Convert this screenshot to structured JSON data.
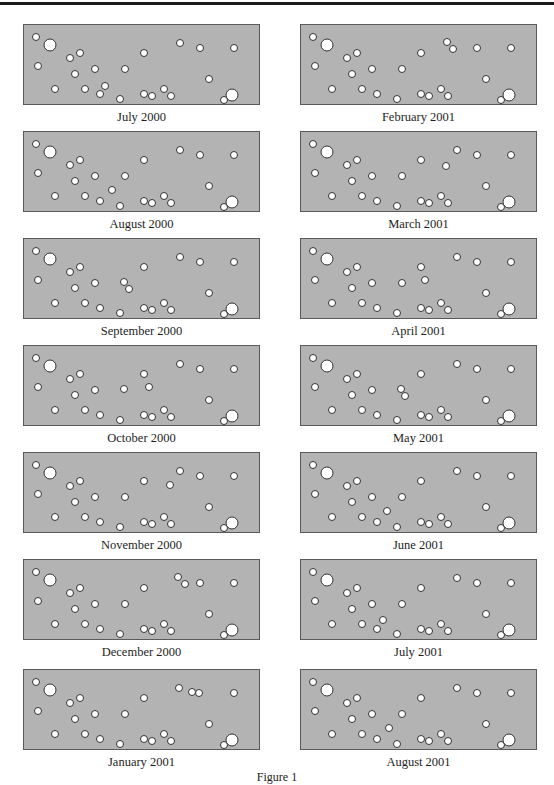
{
  "figure": {
    "caption": "Figure 1",
    "panel_fill": "#b3b3b3",
    "dot_fill": "#ffffff",
    "dot_stroke": "#333333"
  },
  "panels": [
    {
      "label": "July 2000",
      "column": 0,
      "row": 0,
      "variant": "base"
    },
    {
      "label": "August 2000",
      "column": 0,
      "row": 1,
      "variant": "aug2000"
    },
    {
      "label": "September 2000",
      "column": 0,
      "row": 2,
      "variant": "sep2000"
    },
    {
      "label": "October 2000",
      "column": 0,
      "row": 3,
      "variant": "oct2000"
    },
    {
      "label": "November 2000",
      "column": 0,
      "row": 4,
      "variant": "nov2000"
    },
    {
      "label": "December 2000",
      "column": 0,
      "row": 5,
      "variant": "dec2000"
    },
    {
      "label": "January 2001",
      "column": 0,
      "row": 6,
      "variant": "jan2001"
    },
    {
      "label": "February 2001",
      "column": 1,
      "row": 0,
      "variant": "feb2001"
    },
    {
      "label": "March 2001",
      "column": 1,
      "row": 1,
      "variant": "mar2001"
    },
    {
      "label": "April 2001",
      "column": 1,
      "row": 2,
      "variant": "apr2001"
    },
    {
      "label": "May 2001",
      "column": 1,
      "row": 3,
      "variant": "may2001"
    },
    {
      "label": "June 2001",
      "column": 1,
      "row": 4,
      "variant": "jun2001"
    },
    {
      "label": "July 2001",
      "column": 1,
      "row": 5,
      "variant": "jul2001"
    },
    {
      "label": "August 2001",
      "column": 1,
      "row": 6,
      "variant": "aug2001"
    }
  ],
  "dots": {
    "common": [
      [
        12,
        12,
        3.5
      ],
      [
        26,
        20,
        6
      ],
      [
        46,
        33,
        3.5
      ],
      [
        56,
        28,
        3.5
      ],
      [
        14,
        41,
        3.5
      ],
      [
        51,
        49,
        3.5
      ],
      [
        71,
        44,
        3.5
      ],
      [
        120,
        28,
        3.5
      ],
      [
        210,
        23,
        3.5
      ],
      [
        31,
        64,
        3.5
      ],
      [
        61,
        64,
        3.5
      ],
      [
        76,
        69,
        3.5
      ],
      [
        96,
        74,
        3.5
      ],
      [
        120,
        69,
        3.5
      ],
      [
        128,
        71,
        3.5
      ],
      [
        140,
        64,
        3.5
      ],
      [
        147,
        71,
        3.5
      ],
      [
        185,
        54,
        3.5
      ],
      [
        200,
        75,
        3.5
      ],
      [
        208,
        70,
        6
      ]
    ],
    "variants": {
      "base": [
        [
          101,
          44,
          3.5
        ],
        [
          156,
          18,
          3.5
        ],
        [
          176,
          23,
          3.5
        ],
        [
          81,
          61,
          3.5
        ]
      ],
      "aug2000": [
        [
          101,
          44,
          3.5
        ],
        [
          156,
          18,
          3.5
        ],
        [
          176,
          23,
          3.5
        ],
        [
          88,
          58,
          3.5
        ]
      ],
      "sep2000": [
        [
          100,
          43,
          3.5
        ],
        [
          105,
          50,
          3.5
        ],
        [
          156,
          18,
          3.5
        ],
        [
          176,
          23,
          3.5
        ]
      ],
      "oct2000": [
        [
          100,
          43,
          3.5
        ],
        [
          125,
          41,
          3.5
        ],
        [
          156,
          18,
          3.5
        ],
        [
          176,
          23,
          3.5
        ]
      ],
      "nov2000": [
        [
          101,
          44,
          3.5
        ],
        [
          146,
          32,
          3.5
        ],
        [
          156,
          18,
          3.5
        ],
        [
          176,
          23,
          3.5
        ]
      ],
      "dec2000": [
        [
          101,
          44,
          3.5
        ],
        [
          154,
          17,
          3.5
        ],
        [
          161,
          24,
          3.5
        ],
        [
          176,
          23,
          3.5
        ]
      ],
      "jan2001": [
        [
          101,
          44,
          3.5
        ],
        [
          155,
          18,
          3.5
        ],
        [
          168,
          22,
          3.5
        ],
        [
          175,
          23,
          3.5
        ]
      ],
      "feb2001": [
        [
          101,
          44,
          3.5
        ],
        [
          146,
          17,
          3.5
        ],
        [
          152,
          24,
          3.5
        ],
        [
          176,
          23,
          3.5
        ]
      ],
      "mar2001": [
        [
          101,
          44,
          3.5
        ],
        [
          156,
          18,
          3.5
        ],
        [
          145,
          34,
          3.5
        ],
        [
          176,
          23,
          3.5
        ]
      ],
      "apr2001": [
        [
          101,
          44,
          3.5
        ],
        [
          124,
          41,
          3.5
        ],
        [
          156,
          18,
          3.5
        ],
        [
          176,
          23,
          3.5
        ]
      ],
      "may2001": [
        [
          100,
          43,
          3.5
        ],
        [
          104,
          50,
          3.5
        ],
        [
          156,
          18,
          3.5
        ],
        [
          176,
          23,
          3.5
        ]
      ],
      "jun2001": [
        [
          101,
          44,
          3.5
        ],
        [
          156,
          18,
          3.5
        ],
        [
          176,
          23,
          3.5
        ],
        [
          86,
          58,
          3.5
        ]
      ],
      "jul2001": [
        [
          101,
          44,
          3.5
        ],
        [
          156,
          18,
          3.5
        ],
        [
          176,
          23,
          3.5
        ],
        [
          82,
          60,
          3.5
        ]
      ],
      "aug2001": [
        [
          101,
          44,
          3.5
        ],
        [
          156,
          18,
          3.5
        ],
        [
          176,
          23,
          3.5
        ],
        [
          88,
          58,
          3.5
        ]
      ]
    }
  }
}
